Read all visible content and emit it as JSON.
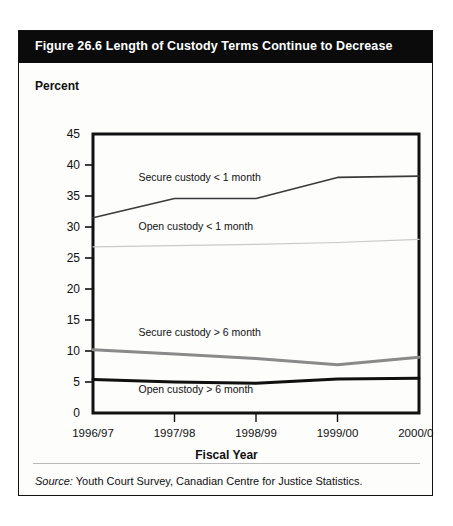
{
  "figure": {
    "title": "Figure 26.6  Length of Custody Terms Continue to Decrease",
    "y_axis_caption": "Percent",
    "x_axis_title": "Fiscal Year",
    "source_prefix": "Source:",
    "source_text": " Youth Court Survey, Canadian Centre for Justice Statistics."
  },
  "colors": {
    "title_bar": "#0b0b0b",
    "title_text": "#ffffff",
    "frame": "#111111",
    "secure_lt_1": "#3a3a3a",
    "open_lt_1": "#c9c9c9",
    "secure_gt_6": "#8a8a8a",
    "open_gt_6": "#101010",
    "card_bg": "#fdfdfc"
  },
  "chart_data": {
    "type": "line",
    "title": "Figure 26.6  Length of Custody Terms Continue to Decrease",
    "xlabel": "Fiscal Year",
    "ylabel": "Percent",
    "x": [
      "1996/97",
      "1997/98",
      "1998/99",
      "1999/00",
      "2000/01"
    ],
    "ylim": [
      0,
      45
    ],
    "yticks": [
      0,
      5,
      10,
      15,
      20,
      25,
      30,
      35,
      40,
      45
    ],
    "grid": false,
    "legend": "inline-labels",
    "series": [
      {
        "name": "Secure custody < 1 month",
        "values": [
          31.5,
          34.6,
          34.6,
          38.0,
          38.2
        ],
        "color": "#3a3a3a",
        "width": 1.6,
        "label_x": "1997/98",
        "label_y": 37.5
      },
      {
        "name": "Open custody < 1 month",
        "values": [
          26.8,
          27.0,
          27.2,
          27.5,
          28.0
        ],
        "color": "#c9c9c9",
        "width": 1.2,
        "label_x": "1997/98",
        "label_y": 29.5
      },
      {
        "name": "Secure custody > 6 month",
        "values": [
          10.2,
          9.5,
          8.8,
          7.8,
          9.0
        ],
        "color": "#8a8a8a",
        "width": 3.0,
        "label_x": "1997/98",
        "label_y": 12.5
      },
      {
        "name": "Open custody > 6 month",
        "values": [
          5.4,
          5.0,
          4.8,
          5.5,
          5.6
        ],
        "color": "#101010",
        "width": 3.0,
        "label_x": "1997/98",
        "label_y": 3.2
      }
    ]
  }
}
